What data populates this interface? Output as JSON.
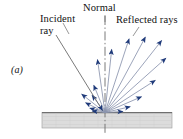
{
  "figure": {
    "panel_label": "(a)",
    "labels": {
      "incident_line1": "Incident",
      "incident_line2": "ray",
      "normal": "Normal",
      "reflected": "Reflected rays"
    },
    "colors": {
      "ray_line": "#8a93ae",
      "arrowhead": "#1f3a7a",
      "incident_ray": "#6b6b6b",
      "normal_line": "#6b6b6b",
      "surface_fill": "#dcdcdc",
      "surface_edge": "#7a7a7a",
      "background": "#ffffff",
      "text": "#111111"
    },
    "geometry": {
      "origin_x": 105,
      "origin_y": 113,
      "surface_left": 42,
      "surface_right": 172,
      "surface_top": 112,
      "surface_bottom": 128,
      "normal_top": 16,
      "normal_bottom": 135,
      "incident_start_x": 56,
      "incident_start_y": 35
    },
    "reflected_rays": [
      {
        "angle_deg": 98,
        "length": 54
      },
      {
        "angle_deg": 112,
        "length": 30
      },
      {
        "angle_deg": 126,
        "length": 22
      },
      {
        "angle_deg": 141,
        "length": 30
      },
      {
        "angle_deg": 152,
        "length": 22
      },
      {
        "angle_deg": 162,
        "length": 16
      },
      {
        "angle_deg": 171,
        "length": 13
      },
      {
        "angle_deg": 84,
        "length": 64
      },
      {
        "angle_deg": 72,
        "length": 78
      },
      {
        "angle_deg": 62,
        "length": 86
      },
      {
        "angle_deg": 52,
        "length": 92
      },
      {
        "angle_deg": 42,
        "length": 82
      },
      {
        "angle_deg": 33,
        "length": 60
      },
      {
        "angle_deg": 24,
        "length": 40
      },
      {
        "angle_deg": 14,
        "length": 26
      },
      {
        "angle_deg": 5,
        "length": 18
      }
    ]
  }
}
